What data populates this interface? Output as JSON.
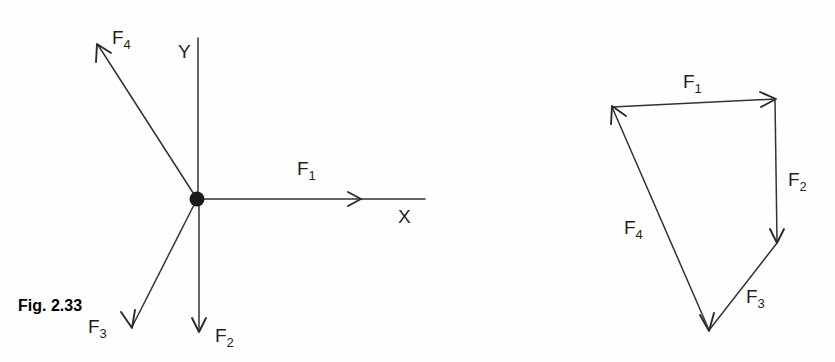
{
  "figure": {
    "caption": "Fig. 2.33",
    "canvas": {
      "width": 835,
      "height": 362,
      "background": "#fefefe"
    },
    "ink_color": "#2b2b2b"
  },
  "space_diagram": {
    "name": "space-diagram",
    "origin": {
      "x": 197,
      "y": 199,
      "dot_radius": 7
    },
    "axes": [
      {
        "id": "y-axis",
        "label": "Y",
        "label_x": 178,
        "label_y": 58,
        "from": {
          "x": 198,
          "y": 199
        },
        "to": {
          "x": 198,
          "y": 38
        },
        "arrow": false
      },
      {
        "id": "x-axis",
        "label": "X",
        "label_x": 398,
        "label_y": 223,
        "from": {
          "x": 197,
          "y": 199
        },
        "to": {
          "x": 425,
          "y": 199
        },
        "arrow": false
      }
    ],
    "forces": [
      {
        "id": "F1",
        "label": "F",
        "subscript": "1",
        "label_x": 297,
        "label_y": 175,
        "from": {
          "x": 197,
          "y": 199
        },
        "to": {
          "x": 360,
          "y": 199
        },
        "arrow_at_tip": true,
        "direction": "positive-x"
      },
      {
        "id": "F2",
        "label": "F",
        "subscript": "2",
        "label_x": 215,
        "label_y": 342,
        "from": {
          "x": 199,
          "y": 199
        },
        "to": {
          "x": 199,
          "y": 332
        },
        "arrow_at_tip": true,
        "direction": "negative-y"
      },
      {
        "id": "F3",
        "label": "F",
        "subscript": "3",
        "label_x": 88,
        "label_y": 333,
        "from": {
          "x": 197,
          "y": 199
        },
        "to": {
          "x": 132,
          "y": 327
        },
        "arrow_at_tip": true,
        "direction": "third-quadrant"
      },
      {
        "id": "F4",
        "label": "F",
        "subscript": "4",
        "label_x": 112,
        "label_y": 44,
        "from": {
          "x": 197,
          "y": 199
        },
        "to": {
          "x": 98,
          "y": 45
        },
        "arrow_at_tip": true,
        "direction": "second-quadrant"
      }
    ]
  },
  "force_polygon": {
    "name": "force-polygon",
    "vertices": [
      {
        "id": "A",
        "x": 612,
        "y": 107
      },
      {
        "id": "B",
        "x": 775,
        "y": 99
      },
      {
        "id": "C",
        "x": 777,
        "y": 243
      },
      {
        "id": "D",
        "x": 709,
        "y": 330
      }
    ],
    "closed": true,
    "forces": [
      {
        "id": "F1",
        "label": "F",
        "subscript": "1",
        "label_x": 683,
        "label_y": 88,
        "from": {
          "x": 612,
          "y": 107
        },
        "to": {
          "x": 775,
          "y": 99
        },
        "arrow_at_tip": true
      },
      {
        "id": "F2",
        "label": "F",
        "subscript": "2",
        "label_x": 788,
        "label_y": 186,
        "from": {
          "x": 775,
          "y": 99
        },
        "to": {
          "x": 777,
          "y": 243
        },
        "arrow_at_tip": true
      },
      {
        "id": "F3",
        "label": "F",
        "subscript": "3",
        "label_x": 746,
        "label_y": 303,
        "from": {
          "x": 777,
          "y": 243
        },
        "to": {
          "x": 709,
          "y": 330
        },
        "arrow_at_tip": true
      },
      {
        "id": "F4",
        "label": "F",
        "subscript": "4",
        "label_x": 624,
        "label_y": 234,
        "from": {
          "x": 709,
          "y": 330
        },
        "to": {
          "x": 612,
          "y": 107
        },
        "arrow_at_tip": true
      }
    ]
  }
}
